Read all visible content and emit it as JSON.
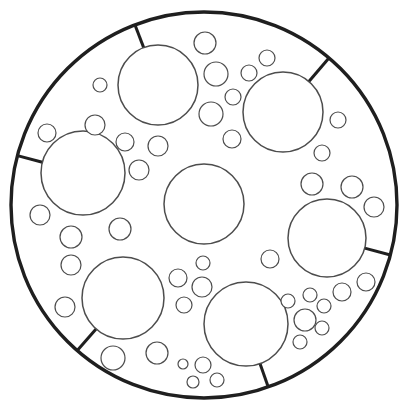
{
  "diagram": {
    "canvas": {
      "width": 407,
      "height": 411
    },
    "colors": {
      "background": "#ffffff",
      "outer_stroke": "#1f1f1f",
      "tick_stroke": "#1f1f1f",
      "node_stroke": "#4d4d4d",
      "link_stroke": "#7d7d7d",
      "fill": "#ffffff"
    },
    "stroke_widths": {
      "outer": 3.4,
      "tick": 3.0,
      "center": 1.5,
      "branch": 1.5,
      "satellite": 1.2,
      "link": 1.0
    },
    "outer": {
      "cx": 204,
      "cy": 205,
      "r": 193
    },
    "center": {
      "cx": 204,
      "cy": 204,
      "r": 40
    },
    "branches": [
      {
        "id": "top-left",
        "circle": {
          "cx": 158,
          "cy": 85,
          "r": 40
        },
        "satellites": [
          {
            "cx": 100,
            "cy": 85,
            "r": 7
          },
          {
            "cx": 205,
            "cy": 43,
            "r": 11
          },
          {
            "cx": 216,
            "cy": 74,
            "r": 12
          },
          {
            "cx": 211,
            "cy": 114,
            "r": 12
          },
          {
            "cx": 158,
            "cy": 146,
            "r": 10
          }
        ]
      },
      {
        "id": "top-right",
        "circle": {
          "cx": 283,
          "cy": 112,
          "r": 40
        },
        "satellites": [
          {
            "cx": 267,
            "cy": 58,
            "r": 8
          },
          {
            "cx": 249,
            "cy": 73,
            "r": 8
          },
          {
            "cx": 233,
            "cy": 97,
            "r": 8
          },
          {
            "cx": 232,
            "cy": 139,
            "r": 9
          },
          {
            "cx": 338,
            "cy": 120,
            "r": 8
          },
          {
            "cx": 322,
            "cy": 153,
            "r": 8
          }
        ]
      },
      {
        "id": "right",
        "circle": {
          "cx": 327,
          "cy": 238,
          "r": 39
        },
        "satellites": [
          {
            "cx": 312,
            "cy": 184,
            "r": 11
          },
          {
            "cx": 352,
            "cy": 187,
            "r": 11
          },
          {
            "cx": 374,
            "cy": 207,
            "r": 10
          },
          {
            "cx": 270,
            "cy": 259,
            "r": 9
          },
          {
            "cx": 366,
            "cy": 282,
            "r": 9
          },
          {
            "cx": 342,
            "cy": 292,
            "r": 9
          }
        ]
      },
      {
        "id": "bottom-right",
        "circle": {
          "cx": 246,
          "cy": 324,
          "r": 42
        },
        "satellites": []
      },
      {
        "id": "bottom-left",
        "circle": {
          "cx": 123,
          "cy": 298,
          "r": 41
        },
        "satellites": [
          {
            "cx": 71,
            "cy": 265,
            "r": 10
          },
          {
            "cx": 65,
            "cy": 307,
            "r": 10
          },
          {
            "cx": 113,
            "cy": 358,
            "r": 12
          },
          {
            "cx": 157,
            "cy": 353,
            "r": 11
          }
        ]
      },
      {
        "id": "left",
        "circle": {
          "cx": 83,
          "cy": 173,
          "r": 42
        },
        "satellites": [
          {
            "cx": 47,
            "cy": 133,
            "r": 9
          },
          {
            "cx": 95,
            "cy": 125,
            "r": 10
          },
          {
            "cx": 139,
            "cy": 170,
            "r": 10
          },
          {
            "cx": 40,
            "cy": 215,
            "r": 10
          },
          {
            "cx": 71,
            "cy": 237,
            "r": 11
          }
        ]
      }
    ],
    "bridge_satellites": [
      {
        "circle": {
          "cx": 125,
          "cy": 142,
          "r": 9
        },
        "connects": [
          "left",
          "top-left"
        ]
      },
      {
        "circle": {
          "cx": 120,
          "cy": 229,
          "r": 11
        },
        "connects": [
          "left",
          "bottom-left"
        ]
      }
    ],
    "clusters": [
      {
        "attach": "bottom-right",
        "hub": {
          "cx": 202,
          "cy": 287,
          "r": 10
        },
        "satellites": [
          {
            "cx": 203,
            "cy": 263,
            "r": 7
          },
          {
            "cx": 178,
            "cy": 278,
            "r": 9
          },
          {
            "cx": 184,
            "cy": 305,
            "r": 8
          }
        ]
      },
      {
        "attach": "bottom-right",
        "hub": {
          "cx": 305,
          "cy": 320,
          "r": 11
        },
        "satellites": [
          {
            "cx": 288,
            "cy": 301,
            "r": 7
          },
          {
            "cx": 310,
            "cy": 295,
            "r": 7
          },
          {
            "cx": 324,
            "cy": 306,
            "r": 7
          },
          {
            "cx": 322,
            "cy": 328,
            "r": 7
          },
          {
            "cx": 300,
            "cy": 342,
            "r": 7
          }
        ]
      },
      {
        "attach": "bottom-right",
        "hub": {
          "cx": 203,
          "cy": 365,
          "r": 8
        },
        "satellites": [
          {
            "cx": 183,
            "cy": 364,
            "r": 5
          },
          {
            "cx": 193,
            "cy": 382,
            "r": 6
          },
          {
            "cx": 217,
            "cy": 380,
            "r": 7
          }
        ]
      }
    ]
  }
}
